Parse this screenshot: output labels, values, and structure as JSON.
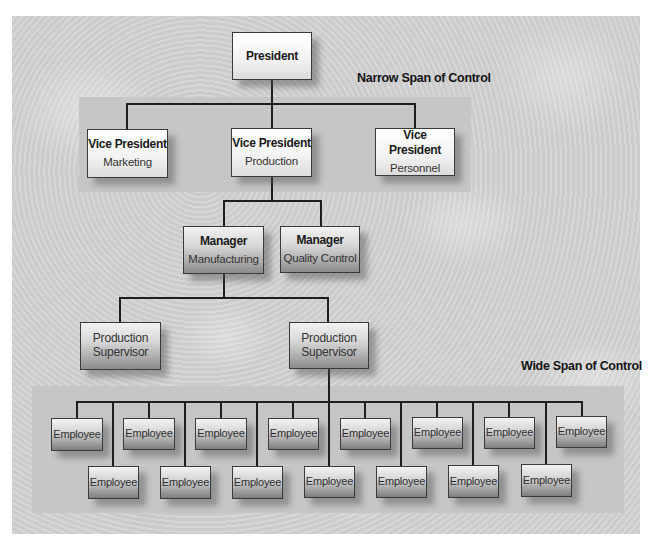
{
  "labels": {
    "narrow_span": "Narrow Span of Control",
    "wide_span": "Wide Span of Control"
  },
  "president": {
    "title": "President"
  },
  "vice_presidents": [
    {
      "title": "Vice President",
      "department": "Marketing"
    },
    {
      "title": "Vice President",
      "department": "Production"
    },
    {
      "title": "Vice President",
      "department": "Personnel"
    }
  ],
  "managers": [
    {
      "title": "Manager",
      "department": "Manufacturing"
    },
    {
      "title": "Manager",
      "department": "Quality Control"
    }
  ],
  "supervisors": [
    {
      "line1": "Production",
      "line2": "Supervisor"
    },
    {
      "line1": "Production",
      "line2": "Supervisor"
    }
  ],
  "employees": {
    "top_row": [
      "Employee",
      "Employee",
      "Employee",
      "Employee",
      "Employee",
      "Employee",
      "Employee",
      "Employee"
    ],
    "bottom_row": [
      "Employee",
      "Employee",
      "Employee",
      "Employee",
      "Employee",
      "Employee",
      "Employee"
    ]
  },
  "colors": {
    "background": "#d2d2d2",
    "band": "#c6c6c6",
    "connector": "#1e1e1e",
    "box_border": "#3a3a3a",
    "text": "#1a1a1a"
  }
}
